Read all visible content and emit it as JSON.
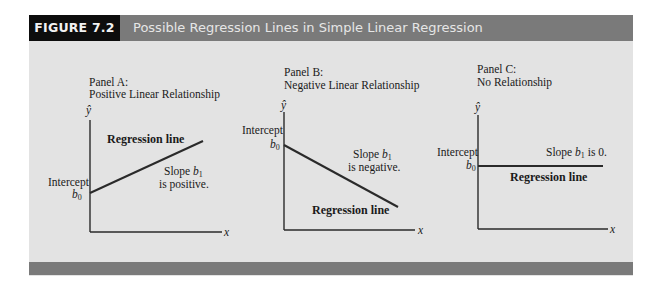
{
  "figure": {
    "label": "FIGURE 7.2",
    "title": "Possible Regression Lines in Simple Linear Regression",
    "colors": {
      "header_bar": "#7a7a7a",
      "label_box": "#0d0d0d",
      "panel_bg": "#e3e3e3",
      "line": "#2a2a2a"
    }
  },
  "panels": [
    {
      "title_line1": "Panel A:",
      "title_line2": "Positive Linear Relationship",
      "y_axis_label": "ŷ",
      "x_axis_label": "x",
      "intercept_label": "Intercept",
      "intercept_symbol": "b",
      "intercept_sub": "0",
      "line_label": "Regression line",
      "slope_text_prefix": "Slope ",
      "slope_symbol": "b",
      "slope_sub": "1",
      "slope_text_suffix": "is positive.",
      "slope_direction": "positive"
    },
    {
      "title_line1": "Panel B:",
      "title_line2": "Negative Linear Relationship",
      "y_axis_label": "ŷ",
      "x_axis_label": "x",
      "intercept_label": "Intercept",
      "intercept_symbol": "b",
      "intercept_sub": "0",
      "line_label": "Regression line",
      "slope_text_prefix": "Slope ",
      "slope_symbol": "b",
      "slope_sub": "1",
      "slope_text_suffix": "is negative.",
      "slope_direction": "negative"
    },
    {
      "title_line1": "Panel C:",
      "title_line2": "No Relationship",
      "y_axis_label": "ŷ",
      "x_axis_label": "x",
      "intercept_label": "Intercept",
      "intercept_symbol": "b",
      "intercept_sub": "0",
      "line_label": "Regression line",
      "slope_text_prefix": "Slope ",
      "slope_symbol": "b",
      "slope_sub": "1",
      "slope_text_suffix": " is 0.",
      "slope_direction": "zero"
    }
  ]
}
